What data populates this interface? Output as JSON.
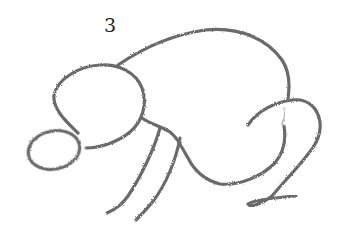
{
  "step": {
    "number": "3"
  },
  "drawing": {
    "subject": "rabbit-sketch",
    "stroke_color": "#6a6a6a",
    "background": "#ffffff",
    "parts": [
      {
        "name": "nose-oval"
      },
      {
        "name": "head-circle"
      },
      {
        "name": "body-back-curve"
      },
      {
        "name": "belly-line"
      },
      {
        "name": "front-leg-left"
      },
      {
        "name": "front-leg-right"
      },
      {
        "name": "hind-leg-haunch"
      },
      {
        "name": "hind-foot"
      }
    ]
  }
}
